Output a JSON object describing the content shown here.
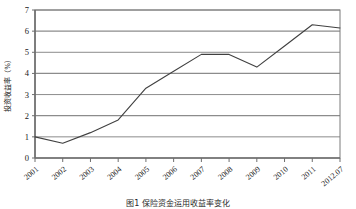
{
  "figure": {
    "caption": "图1 保险资金运用收益率变化",
    "ylabel": "投资收益率（%）"
  },
  "chart_data": {
    "type": "line",
    "title": "",
    "xlabel": "",
    "ylabel": "投资收益率（%）",
    "categories": [
      "2001",
      "2002",
      "2003",
      "2004",
      "2005",
      "2006",
      "2007",
      "2008",
      "2009",
      "2010",
      "2011",
      "2012.07"
    ],
    "values": [
      1.0,
      0.7,
      1.2,
      1.8,
      3.3,
      4.1,
      4.9,
      4.9,
      4.3,
      5.3,
      6.3,
      6.15
    ],
    "series": [
      {
        "name": "投资收益率",
        "values": [
          1.0,
          0.7,
          1.2,
          1.8,
          3.3,
          4.1,
          4.9,
          4.9,
          4.3,
          5.3,
          6.3,
          6.15
        ],
        "color": "#404040"
      }
    ],
    "ylim": [
      0,
      7
    ],
    "yticks": [
      0,
      1,
      2,
      3,
      4,
      5,
      6,
      7
    ],
    "ytick_labels": [
      "0",
      "1",
      "2",
      "3",
      "4",
      "5",
      "6",
      "7"
    ],
    "xtick_labels": [
      "2001",
      "2002",
      "2003",
      "2004",
      "2005",
      "2006",
      "2007",
      "2008",
      "2009",
      "2010",
      "2011",
      "2012.07"
    ],
    "grid": true,
    "grid_axis": "y",
    "grid_color": "#8c8c8c",
    "legend": false,
    "legend_position": "none",
    "frame": true,
    "frame_color": "#7a7a7a"
  }
}
